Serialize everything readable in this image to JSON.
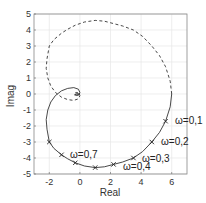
{
  "chart_data": {
    "type": "line",
    "title": "",
    "xlabel": "Real",
    "ylabel": "Imag",
    "xlim": [
      -3,
      7
    ],
    "ylim": [
      -5,
      5
    ],
    "grid": true,
    "xticks": [
      "-2",
      "0",
      "2",
      "4",
      "6"
    ],
    "yticks": [
      "5",
      "4",
      "3",
      "2",
      "1",
      "0",
      "-1",
      "-2",
      "-3",
      "-4",
      "-5"
    ],
    "series": [
      {
        "name": "positive frequencies",
        "style": "solid",
        "points": [
          [
            6.0,
            0.0
          ],
          [
            5.9,
            -0.8
          ],
          [
            5.6,
            -1.7
          ],
          [
            5.2,
            -2.4
          ],
          [
            4.7,
            -3.0
          ],
          [
            4.1,
            -3.6
          ],
          [
            3.5,
            -4.0
          ],
          [
            2.8,
            -4.25
          ],
          [
            2.2,
            -4.4
          ],
          [
            1.6,
            -4.55
          ],
          [
            1.0,
            -4.6
          ],
          [
            0.3,
            -4.5
          ],
          [
            -0.3,
            -4.3
          ],
          [
            -0.8,
            -4.05
          ],
          [
            -1.2,
            -3.8
          ],
          [
            -1.7,
            -3.4
          ],
          [
            -2.0,
            -3.0
          ],
          [
            -2.15,
            -2.2
          ],
          [
            -2.2,
            -1.6
          ],
          [
            -2.1,
            -1.0
          ],
          [
            -1.9,
            -0.5
          ],
          [
            -1.6,
            -0.1
          ],
          [
            -1.2,
            0.2
          ],
          [
            -0.8,
            0.35
          ],
          [
            -0.4,
            0.4
          ],
          [
            -0.1,
            0.3
          ],
          [
            0.0,
            0.1
          ],
          [
            -0.05,
            -0.05
          ],
          [
            -0.2,
            -0.1
          ],
          [
            -0.35,
            -0.05
          ],
          [
            -0.2,
            0.0
          ],
          [
            0.0,
            0.0
          ]
        ]
      },
      {
        "name": "negative frequencies",
        "style": "dashed",
        "points": [
          [
            6.0,
            0.0
          ],
          [
            5.9,
            0.8
          ],
          [
            5.6,
            1.7
          ],
          [
            5.2,
            2.4
          ],
          [
            4.7,
            3.0
          ],
          [
            4.1,
            3.6
          ],
          [
            3.5,
            4.0
          ],
          [
            2.8,
            4.25
          ],
          [
            2.2,
            4.4
          ],
          [
            1.6,
            4.55
          ],
          [
            1.0,
            4.6
          ],
          [
            0.3,
            4.5
          ],
          [
            -0.3,
            4.3
          ],
          [
            -0.8,
            4.05
          ],
          [
            -1.2,
            3.8
          ],
          [
            -1.7,
            3.4
          ],
          [
            -2.0,
            3.0
          ],
          [
            -2.15,
            2.2
          ],
          [
            -2.2,
            1.6
          ],
          [
            -2.1,
            1.0
          ],
          [
            -1.9,
            0.5
          ],
          [
            -1.6,
            0.1
          ],
          [
            -1.2,
            -0.2
          ],
          [
            -0.8,
            -0.35
          ],
          [
            -0.4,
            -0.4
          ],
          [
            -0.1,
            -0.3
          ],
          [
            0.0,
            -0.1
          ],
          [
            -0.05,
            0.05
          ],
          [
            -0.2,
            0.1
          ],
          [
            -0.35,
            0.05
          ],
          [
            -0.2,
            0.0
          ],
          [
            0.0,
            0.0
          ]
        ]
      }
    ],
    "markers": [
      {
        "x": 5.6,
        "y": -1.7,
        "label": "ω=0,1"
      },
      {
        "x": 4.7,
        "y": -3.0,
        "label": "ω=0,2"
      },
      {
        "x": 3.5,
        "y": -4.0,
        "label": "ω=0,3"
      },
      {
        "x": 2.2,
        "y": -4.4,
        "label": "ω=0,4"
      },
      {
        "x": 1.0,
        "y": -4.6,
        "label": ""
      },
      {
        "x": -0.3,
        "y": -4.3,
        "label": ""
      },
      {
        "x": -1.2,
        "y": -3.8,
        "label": "ω=0,7"
      },
      {
        "x": -2.0,
        "y": -3.0,
        "label": ""
      }
    ]
  },
  "labels": {
    "xlabel": "Real",
    "ylabel": "Imag",
    "w01": "ω=0,1",
    "w02": "ω=0,2",
    "w03": "ω=0,3",
    "w04": "ω=0,4",
    "w07": "ω=0,7"
  }
}
